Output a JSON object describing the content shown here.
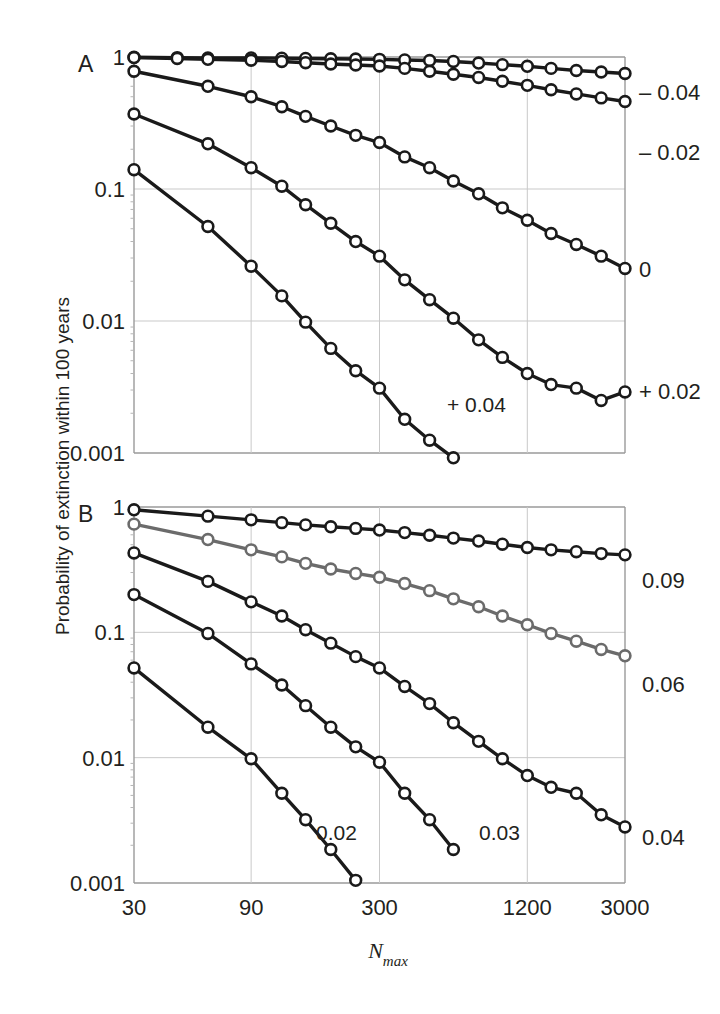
{
  "figure": {
    "y_axis_title": "Probability of extinction within 100 years",
    "x_axis_title_base": "N",
    "x_axis_title_sub": "max",
    "x_tick_labels": [
      "30",
      "90",
      "300",
      "1200",
      "3000"
    ],
    "y_tick_labels": [
      "1",
      "0.1",
      "0.01",
      "0.001"
    ],
    "panelA_letter": "A",
    "panelB_letter": "B"
  },
  "panelA": {
    "side_labels": [
      "– 0.04",
      "– 0.02",
      "0",
      "+ 0.02"
    ],
    "inline_labels": [
      "+ 0.04"
    ]
  },
  "panelB": {
    "side_labels": [
      "0.09",
      "0.06",
      "0.04"
    ],
    "inline_labels": [
      "0.02",
      "0.03"
    ]
  },
  "chart_data": {
    "type": "line",
    "title": "",
    "xlabel": "Nmax",
    "ylabel": "Probability of extinction within 100 years",
    "xscale": "log",
    "yscale": "log",
    "xlim": [
      30,
      3000
    ],
    "ylim": [
      0.001,
      1
    ],
    "xticks": [
      30,
      90,
      300,
      1200,
      3000
    ],
    "yticks": [
      1,
      0.1,
      0.01,
      0.001
    ],
    "grid": true,
    "legend_position": "right-of-axes (curve end labels)",
    "marker": "open-circle",
    "panels": [
      {
        "panel": "A",
        "label": "A",
        "series": [
          {
            "name": "-0.04",
            "label": "– 0.04",
            "color": "#1a1a1a",
            "x": [
              30,
              45,
              60,
              90,
              120,
              150,
              190,
              240,
              300,
              380,
              480,
              600,
              760,
              950,
              1200,
              1500,
              1900,
              2400,
              3000
            ],
            "y": [
              0.995,
              0.99,
              0.985,
              0.985,
              0.98,
              0.975,
              0.97,
              0.965,
              0.96,
              0.95,
              0.94,
              0.925,
              0.9,
              0.875,
              0.85,
              0.82,
              0.79,
              0.77,
              0.75
            ]
          },
          {
            "name": "-0.02",
            "label": "– 0.02",
            "color": "#1a1a1a",
            "x": [
              30,
              45,
              60,
              90,
              120,
              150,
              190,
              240,
              300,
              380,
              480,
              600,
              760,
              950,
              1200,
              1500,
              1900,
              2400,
              3000
            ],
            "y": [
              0.99,
              0.975,
              0.96,
              0.945,
              0.925,
              0.905,
              0.885,
              0.87,
              0.855,
              0.82,
              0.78,
              0.74,
              0.7,
              0.655,
              0.61,
              0.565,
              0.525,
              0.49,
              0.46
            ]
          },
          {
            "name": "0",
            "label": "0",
            "color": "#1a1a1a",
            "x": [
              30,
              60,
              90,
              120,
              150,
              190,
              240,
              300,
              380,
              480,
              600,
              760,
              950,
              1200,
              1500,
              1900,
              2400,
              3000
            ],
            "y": [
              0.78,
              0.6,
              0.5,
              0.42,
              0.355,
              0.3,
              0.255,
              0.225,
              0.175,
              0.145,
              0.115,
              0.092,
              0.072,
              0.058,
              0.046,
              0.038,
              0.031,
              0.025
            ]
          },
          {
            "name": "+0.02",
            "label": "+ 0.02",
            "color": "#1a1a1a",
            "x": [
              30,
              60,
              90,
              120,
              150,
              190,
              240,
              300,
              380,
              480,
              600,
              760,
              950,
              1200,
              1500,
              1900,
              2400,
              3000
            ],
            "y": [
              0.37,
              0.22,
              0.145,
              0.105,
              0.076,
              0.055,
              0.04,
              0.031,
              0.0205,
              0.0145,
              0.0105,
              0.0072,
              0.0053,
              0.004,
              0.0033,
              0.0031,
              0.0025,
              0.0029
            ]
          },
          {
            "name": "+0.04",
            "label": "+ 0.04",
            "color": "#1a1a1a",
            "x": [
              30,
              60,
              90,
              120,
              150,
              190,
              240,
              300,
              380,
              480,
              600
            ],
            "y": [
              0.14,
              0.052,
              0.026,
              0.0155,
              0.0098,
              0.0062,
              0.0042,
              0.0031,
              0.0018,
              0.00125,
              0.00092
            ]
          }
        ]
      },
      {
        "panel": "B",
        "label": "B",
        "series": [
          {
            "name": "0.09",
            "label": "0.09",
            "color": "#1a1a1a",
            "x": [
              30,
              60,
              90,
              120,
              150,
              190,
              240,
              300,
              380,
              480,
              600,
              760,
              950,
              1200,
              1500,
              1900,
              2400,
              3000
            ],
            "y": [
              0.95,
              0.845,
              0.79,
              0.75,
              0.72,
              0.695,
              0.675,
              0.655,
              0.625,
              0.595,
              0.565,
              0.535,
              0.505,
              0.475,
              0.455,
              0.44,
              0.425,
              0.415
            ]
          },
          {
            "name": "0.06",
            "label": "0.06",
            "color": "#6b6b6b",
            "x": [
              30,
              60,
              90,
              120,
              150,
              190,
              240,
              300,
              380,
              480,
              600,
              760,
              950,
              1200,
              1500,
              1900,
              2400,
              3000
            ],
            "y": [
              0.73,
              0.55,
              0.455,
              0.4,
              0.355,
              0.32,
              0.295,
              0.275,
              0.245,
              0.215,
              0.185,
              0.16,
              0.135,
              0.115,
              0.098,
              0.085,
              0.073,
              0.065
            ]
          },
          {
            "name": "0.04",
            "label": "0.04",
            "color": "#1a1a1a",
            "x": [
              30,
              60,
              90,
              120,
              150,
              190,
              240,
              300,
              380,
              480,
              600,
              760,
              950,
              1200,
              1500,
              1900,
              2400,
              3000
            ],
            "y": [
              0.43,
              0.255,
              0.175,
              0.135,
              0.105,
              0.082,
              0.064,
              0.052,
              0.037,
              0.027,
              0.019,
              0.0135,
              0.0098,
              0.0072,
              0.0058,
              0.0052,
              0.0035,
              0.0028
            ]
          },
          {
            "name": "0.03",
            "label": "0.03",
            "color": "#1a1a1a",
            "x": [
              30,
              60,
              90,
              120,
              150,
              190,
              240,
              300,
              380,
              480,
              600
            ],
            "y": [
              0.2,
              0.098,
              0.056,
              0.038,
              0.026,
              0.0175,
              0.0122,
              0.0092,
              0.0052,
              0.0032,
              0.00185
            ]
          },
          {
            "name": "0.02",
            "label": "0.02",
            "color": "#1a1a1a",
            "x": [
              30,
              60,
              90,
              120,
              150,
              190,
              240
            ],
            "y": [
              0.052,
              0.0175,
              0.0098,
              0.0052,
              0.0032,
              0.00185,
              0.00105
            ]
          }
        ]
      }
    ]
  }
}
